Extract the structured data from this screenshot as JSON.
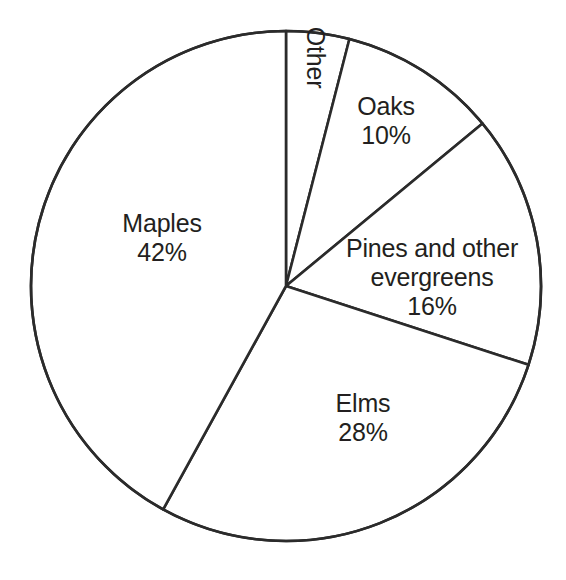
{
  "chart_data": {
    "type": "pie",
    "title": "",
    "subtitle": "",
    "xlabel": "",
    "ylabel": "",
    "legend_position": "none",
    "grid": false,
    "units": "percent",
    "start_angle_deg": 0,
    "direction": "clockwise",
    "categories": [
      "Other",
      "Oaks",
      "Pines and other evergreens",
      "Elms",
      "Maples"
    ],
    "values": [
      4,
      10,
      16,
      28,
      42
    ],
    "slices": [
      {
        "name": "Other",
        "label": "Other",
        "value": 4,
        "value_text": "",
        "label_text": "Other",
        "start_angle_deg": 0,
        "end_angle_deg": 14.4,
        "sweep_deg": 14.4,
        "rotated": true,
        "rotation_deg": 90,
        "fill": "#ffffff"
      },
      {
        "name": "Oaks",
        "label": "Oaks",
        "value": 10,
        "value_text": "10%",
        "label_text": "Oaks\n10%",
        "start_angle_deg": 14.4,
        "end_angle_deg": 50.4,
        "sweep_deg": 36,
        "rotated": false,
        "rotation_deg": 0,
        "fill": "#ffffff"
      },
      {
        "name": "Pines and other evergreens",
        "label": "Pines and other evergreens",
        "value": 16,
        "value_text": "16%",
        "label_text": "Pines and other\nevergreens\n16%",
        "start_angle_deg": 50.4,
        "end_angle_deg": 108.0,
        "sweep_deg": 57.6,
        "rotated": false,
        "rotation_deg": 0,
        "fill": "#ffffff"
      },
      {
        "name": "Elms",
        "label": "Elms",
        "value": 28,
        "value_text": "28%",
        "label_text": "Elms\n28%",
        "start_angle_deg": 108.0,
        "end_angle_deg": 208.8,
        "sweep_deg": 100.8,
        "rotated": false,
        "rotation_deg": 0,
        "fill": "#ffffff"
      },
      {
        "name": "Maples",
        "label": "Maples",
        "value": 42,
        "value_text": "42%",
        "label_text": "Maples\n42%",
        "start_angle_deg": 208.8,
        "end_angle_deg": 360.0,
        "sweep_deg": 151.2,
        "rotated": false,
        "rotation_deg": 0,
        "fill": "#ffffff"
      }
    ]
  },
  "style": {
    "background": "#ffffff",
    "stroke": "#2b2b2b",
    "stroke_width": 2.6,
    "text_color": "#231f20",
    "slice_fill": "#ffffff"
  },
  "geometry": {
    "center_x": 286,
    "center_y": 286,
    "radius": 255
  }
}
